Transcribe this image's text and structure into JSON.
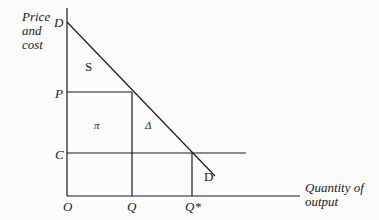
{
  "diagram": {
    "y_axis_title": [
      "Price",
      "and",
      "cost"
    ],
    "x_axis_title": [
      "Quantity of",
      "output"
    ],
    "labels": {
      "D_top": "D",
      "D_bottom": "D",
      "S": "S",
      "P": "P",
      "C": "C",
      "O": "O",
      "Q": "Q",
      "Q_star": "Q*",
      "pi": "π",
      "delta": "Δ"
    },
    "colors": {
      "line": "#1a1a1a",
      "background": "#fcfcfc"
    }
  }
}
